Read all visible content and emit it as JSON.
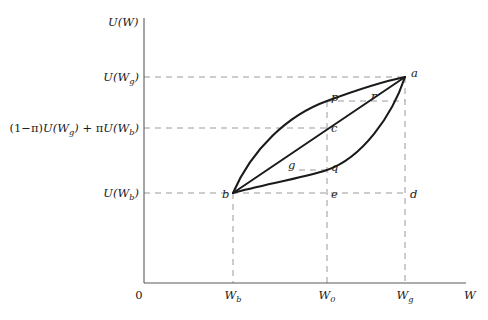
{
  "figure": {
    "type": "utility-function-diagram",
    "axes": {
      "y_axis_title": "U(W)",
      "x_axis_title": "W",
      "origin_label": "0",
      "y_ticks": [
        {
          "id": "u-wg",
          "label": "U(W_g)",
          "text_main": "U(W",
          "text_sub": "g",
          "text_tail": ")",
          "y": 77
        },
        {
          "id": "expected-utility",
          "label": "(1−π)U(W_g) + πU(W_b)",
          "y": 128
        },
        {
          "id": "u-wb",
          "label": "U(W_b)",
          "text_main": "U(W",
          "text_sub": "b",
          "text_tail": ")",
          "y": 193
        }
      ],
      "x_ticks": [
        {
          "id": "wb",
          "label": "W_b",
          "text_main": "W",
          "text_sub": "b",
          "x": 233
        },
        {
          "id": "w0",
          "label": "W_0",
          "text_main": "W",
          "text_sub": "0",
          "x": 327
        },
        {
          "id": "wg",
          "label": "W_g",
          "text_main": "W",
          "text_sub": "g",
          "x": 405
        }
      ]
    },
    "points": [
      {
        "name": "a",
        "x": 405,
        "y": 77,
        "desc": "upper-right vertex where both curves and chord meet"
      },
      {
        "name": "b",
        "x": 233,
        "y": 193,
        "desc": "lower-left vertex where both curves and chord meet"
      },
      {
        "name": "c",
        "x": 327,
        "y": 128,
        "desc": "chord at W_0, expected utility level"
      },
      {
        "name": "d",
        "x": 405,
        "y": 193,
        "desc": "bottom dashed line at W_g"
      },
      {
        "name": "e",
        "x": 327,
        "y": 193,
        "desc": "bottom dashed line at W_0"
      },
      {
        "name": "g",
        "x": 300,
        "y": 170,
        "desc": "chord point level with q"
      },
      {
        "name": "p",
        "x": 327,
        "y": 101,
        "desc": "concave curve at W_0"
      },
      {
        "name": "q",
        "x": 327,
        "y": 170,
        "desc": "convex curve at W_0"
      },
      {
        "name": "r",
        "x": 368,
        "y": 101,
        "desc": "chord point level with p"
      }
    ],
    "curves": [
      {
        "id": "concave-utility-curve",
        "shape": "concave",
        "from": "b",
        "to": "a",
        "through": "p"
      },
      {
        "id": "convex-utility-curve",
        "shape": "convex",
        "from": "b",
        "to": "a",
        "through": "q"
      },
      {
        "id": "chord-line",
        "shape": "straight",
        "from": "b",
        "to": "a",
        "through": "c"
      }
    ],
    "guides": [
      {
        "id": "guide-u-wg",
        "orientation": "horizontal",
        "y": 77,
        "x1": 144,
        "x2": 405
      },
      {
        "id": "guide-expected-utility",
        "orientation": "horizontal",
        "y": 128,
        "x1": 144,
        "x2": 327
      },
      {
        "id": "guide-u-wb",
        "orientation": "horizontal",
        "y": 193,
        "x1": 144,
        "x2": 405
      },
      {
        "id": "guide-p-r",
        "orientation": "horizontal",
        "y": 101,
        "x1": 327,
        "x2": 405
      },
      {
        "id": "guide-g-q",
        "orientation": "horizontal",
        "y": 170,
        "x1": 300,
        "x2": 327
      },
      {
        "id": "guide-wb",
        "orientation": "vertical",
        "x": 233,
        "y1": 193,
        "y2": 283
      },
      {
        "id": "guide-w0",
        "orientation": "vertical",
        "x": 327,
        "y1": 101,
        "y2": 283
      },
      {
        "id": "guide-wg",
        "orientation": "vertical",
        "x": 405,
        "y1": 77,
        "y2": 283
      }
    ],
    "colors": {
      "curve": "#1a1a1a",
      "axis": "#5b5b5b",
      "guide": "#9a9a9a",
      "background": "#ffffff"
    }
  },
  "expected_utility_expr": {
    "open_paren": "(1",
    "minus": "−",
    "pi1": "π",
    "close_paren": ")",
    "u1": "U(W",
    "sub1": "g",
    "u1_tail": ")",
    "plus": " + ",
    "pi2": "π",
    "u2": "U(W",
    "sub2": "b",
    "u2_tail": ")"
  }
}
